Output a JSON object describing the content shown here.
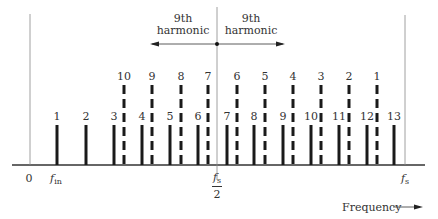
{
  "diagram": {
    "title": "",
    "axis": {
      "xlabel": "Frequency",
      "ticks": {
        "zero": "0",
        "fin_main": "f",
        "fin_sub": "in",
        "half_num_main": "f",
        "half_num_sub": "s",
        "half_den": "2",
        "fs_main": "f",
        "fs_sub": "s"
      }
    },
    "annotations": {
      "left_arrow_label_line1": "9th",
      "left_arrow_label_line2": "harmonic",
      "right_arrow_label_line1": "9th",
      "right_arrow_label_line2": "harmonic"
    },
    "colors": {
      "bar": "#1a1a1a",
      "axis": "#333333",
      "guide": "#888888"
    }
  },
  "chart_data": {
    "type": "bar",
    "xlabel": "Frequency",
    "ylabel": "",
    "series": [
      {
        "name": "harmonics (solid)",
        "style": "solid",
        "labels": [
          "1",
          "2",
          "3",
          "4",
          "5",
          "6",
          "7",
          "8",
          "9",
          "10",
          "11",
          "12",
          "13"
        ],
        "x": [
          57,
          86,
          114,
          142,
          170,
          198,
          227,
          254,
          283,
          311,
          339,
          367,
          394
        ],
        "height": 1
      },
      {
        "name": "aliased/folded (dashed)",
        "style": "dashed",
        "labels": [
          "10",
          "9",
          "8",
          "7",
          "6",
          "5",
          "4",
          "3",
          "2",
          "1"
        ],
        "x": [
          124,
          152,
          181,
          208,
          237,
          265,
          293,
          321,
          349,
          377
        ],
        "height": 2
      }
    ],
    "markers": {
      "zero_x": 30,
      "fin_x": 57,
      "half_fs_x": 217,
      "fs_x": 405
    }
  }
}
